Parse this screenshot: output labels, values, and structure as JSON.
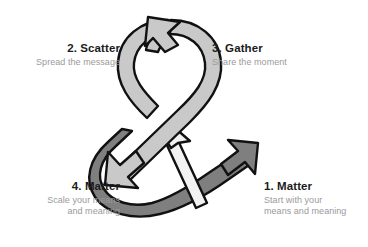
{
  "page": {
    "background_color": "#ffffff"
  },
  "graphic": {
    "name": "ampersand-cycle",
    "description": "Ampersand formed from looping arrow ribbons",
    "colors": {
      "light_band": "#c9c9c9",
      "dark_band": "#7f7f7f",
      "white_band": "#f2f2f2",
      "outline": "#111111"
    },
    "arrows": [
      {
        "id": "arrow-top",
        "direction": "up-left",
        "band": "light"
      },
      {
        "id": "arrow-lower-left",
        "direction": "down-left",
        "band": "light"
      },
      {
        "id": "arrow-center-up",
        "direction": "up",
        "band": "white"
      },
      {
        "id": "arrow-tail-right",
        "direction": "up-right",
        "band": "dark"
      }
    ]
  },
  "steps": [
    {
      "id": "step-1",
      "title": "1. Matter",
      "subtitle_lines": [
        "Start with your",
        "means and meaning"
      ],
      "align": "left"
    },
    {
      "id": "step-2",
      "title": "2. Scatter",
      "subtitle_lines": [
        "Spread the message"
      ],
      "align": "right"
    },
    {
      "id": "step-3",
      "title": "3. Gather",
      "subtitle_lines": [
        "Share the moment"
      ],
      "align": "left"
    },
    {
      "id": "step-4",
      "title": "4. Matter",
      "subtitle_lines": [
        "Scale your means",
        "and meaning"
      ],
      "align": "right"
    }
  ],
  "text_colors": {
    "title": "#1c1c1c",
    "subtitle": "#9a9a9a"
  }
}
